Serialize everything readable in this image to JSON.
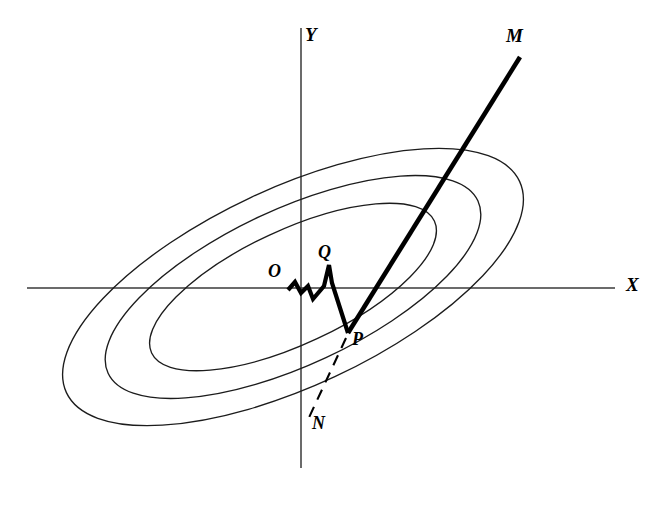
{
  "figure": {
    "width": 666,
    "height": 505,
    "background_color": "#ffffff"
  },
  "colors": {
    "axis": "#3a3a3a",
    "contour": "#1c1c1c",
    "path": "#000000",
    "dashed": "#000000"
  },
  "axes": {
    "x_label": "X",
    "y_label": "Y",
    "x_axis": {
      "y": 288,
      "x_start": 27,
      "x_end": 615
    },
    "y_axis": {
      "x": 301,
      "y_start": 28,
      "y_end": 468
    },
    "x_label_pos": {
      "x": 628,
      "y": 285
    },
    "y_label_pos": {
      "x": 305,
      "y": 35
    }
  },
  "labels": [
    {
      "id": "O",
      "text": "O",
      "x": 272,
      "y": 270,
      "size": 17
    },
    {
      "id": "Q",
      "text": "Q",
      "x": 322,
      "y": 251,
      "size": 17
    },
    {
      "id": "P",
      "text": "P",
      "x": 355,
      "y": 337,
      "size": 17
    },
    {
      "id": "M",
      "text": "M",
      "x": 508,
      "y": 24,
      "size": 18
    },
    {
      "id": "N",
      "text": "N",
      "x": 314,
      "y": 418,
      "size": 17
    }
  ],
  "contours": {
    "type": "concentric-tilted-ellipses",
    "count": 3,
    "center": {
      "x": 293,
      "y": 287
    },
    "rotation_deg": -25,
    "rings": [
      {
        "name": "outer",
        "rx": 250,
        "ry": 99
      },
      {
        "name": "middle",
        "rx": 204,
        "ry": 78
      },
      {
        "name": "inner",
        "rx": 156,
        "ry": 57
      }
    ]
  },
  "walk": {
    "name": "random-walk-path",
    "description": "Bold zigzag from O to Q to P",
    "points": [
      {
        "x": 288,
        "y": 290
      },
      {
        "x": 295,
        "y": 282
      },
      {
        "x": 301,
        "y": 293
      },
      {
        "x": 308,
        "y": 286
      },
      {
        "x": 313,
        "y": 299
      },
      {
        "x": 324,
        "y": 286
      },
      {
        "x": 329,
        "y": 265
      },
      {
        "x": 332,
        "y": 283
      },
      {
        "x": 348,
        "y": 333
      }
    ]
  },
  "ray": {
    "name": "ray-P-to-M",
    "from": {
      "x": 348,
      "y": 333
    },
    "to": {
      "x": 520,
      "y": 57
    }
  },
  "dashed": {
    "name": "dashed-extension-P-to-N",
    "from": {
      "x": 346,
      "y": 338
    },
    "to": {
      "x": 306,
      "y": 424
    }
  }
}
